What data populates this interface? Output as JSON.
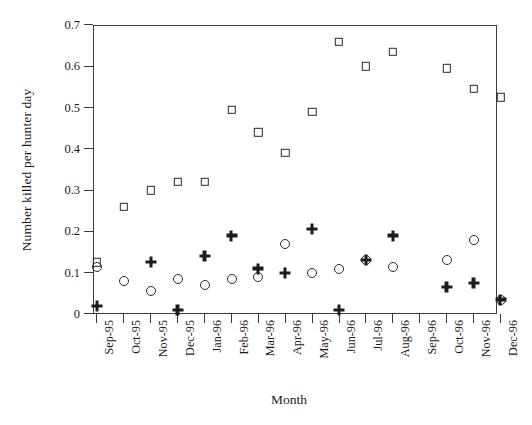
{
  "chart_data": {
    "type": "scatter",
    "title": "",
    "xlabel": "Month",
    "ylabel": "Number killed per hunter day",
    "categories": [
      "Sep-95",
      "Oct-95",
      "Nov-95",
      "Dec-95",
      "Jan-96",
      "Feb-96",
      "Mar-96",
      "Apr-96",
      "May-96",
      "Jun-96",
      "Jul-96",
      "Aug-96",
      "Sep-96",
      "Oct-96",
      "Nov-96",
      "Dec-96"
    ],
    "ylim": [
      0,
      0.7
    ],
    "yticks": [
      "0",
      "0.1",
      "0.2",
      "0.3",
      "0.4",
      "0.5",
      "0.6",
      "0.7"
    ],
    "ytick_values": [
      0,
      0.1,
      0.2,
      0.3,
      0.4,
      0.5,
      0.6,
      0.7
    ],
    "grid": false,
    "legend": "none",
    "series": [
      {
        "name": "square-series",
        "marker": "open-square",
        "color": "#2a2a2a",
        "values": [
          0.125,
          0.26,
          0.3,
          0.32,
          0.32,
          0.495,
          0.44,
          0.39,
          0.49,
          0.66,
          0.6,
          0.635,
          null,
          0.595,
          0.545,
          0.525
        ]
      },
      {
        "name": "circle-series",
        "marker": "open-circle",
        "color": "#2a2a2a",
        "values": [
          0.115,
          0.08,
          0.055,
          0.085,
          0.07,
          0.085,
          0.09,
          0.17,
          0.1,
          0.11,
          0.13,
          0.115,
          null,
          0.13,
          0.18,
          0.035
        ]
      },
      {
        "name": "plus-series",
        "marker": "plus",
        "color": "#1c1c1c",
        "values": [
          0.02,
          null,
          0.125,
          0.01,
          0.14,
          0.19,
          0.11,
          0.1,
          0.205,
          0.01,
          0.13,
          0.19,
          null,
          0.065,
          0.075,
          0.035
        ]
      }
    ]
  },
  "axis": {
    "y_title": "Number killed per hunter day",
    "x_title": "Month"
  }
}
